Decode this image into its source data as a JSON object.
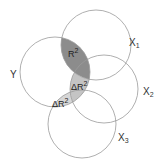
{
  "diagram": {
    "type": "venn",
    "circles": [
      {
        "id": "Y",
        "label": "Y",
        "cx": 55,
        "cy": 72,
        "r": 35
      },
      {
        "id": "X1",
        "label": "X",
        "sub": "1",
        "cx": 96,
        "cy": 45,
        "r": 35
      },
      {
        "id": "X2",
        "label": "X",
        "sub": "2",
        "cx": 104,
        "cy": 89,
        "r": 34
      },
      {
        "id": "X3",
        "label": "X",
        "sub": "3",
        "cx": 82,
        "cy": 124,
        "r": 34
      }
    ],
    "regions": [
      {
        "id": "r2",
        "label": "R",
        "sup": "2",
        "prefix": "",
        "fill": "#8c8c8c",
        "between": [
          "Y",
          "X1"
        ]
      },
      {
        "id": "dr2a",
        "label": "R",
        "sup": "2",
        "prefix": "Δ",
        "fill": "#c4c4c4",
        "between": [
          "Y",
          "X2"
        ]
      },
      {
        "id": "dr2b",
        "label": "R",
        "sup": "2",
        "prefix": "Δ",
        "fill": "#d6d6d6",
        "between": [
          "Y",
          "X3"
        ]
      }
    ],
    "colors": {
      "stroke": "#9a9a9a",
      "background": "#ffffff",
      "text": "#333333"
    }
  }
}
